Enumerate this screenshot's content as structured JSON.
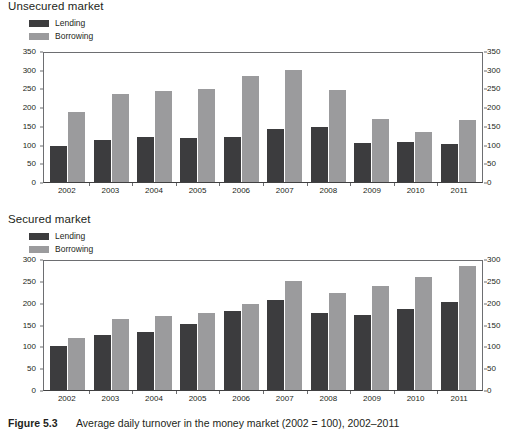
{
  "caption": {
    "figure_number": "Figure 5.3",
    "text": "Average daily turnover in the money market (2002 = 100), 2002–2011"
  },
  "legend": {
    "lending_label": "Lending",
    "borrowing_label": "Borrowing",
    "lending_color": "#3c3c3e",
    "borrowing_color": "#9b9b9d"
  },
  "panels": [
    {
      "title": "Unsecured market"
    },
    {
      "title": "Secured market"
    }
  ],
  "chart_data": [
    {
      "type": "bar",
      "title": "Unsecured market",
      "xlabel": "",
      "ylabel": "",
      "ylim": [
        0,
        350
      ],
      "yticks": [
        0,
        50,
        100,
        150,
        200,
        250,
        300,
        350
      ],
      "ytick_labels": [
        "0",
        "50",
        "100",
        "150",
        "200",
        "250",
        "300",
        "350"
      ],
      "dual_axis": true,
      "grid": false,
      "legend_position": "above-left",
      "categories": [
        "2002",
        "2003",
        "2004",
        "2005",
        "2006",
        "2007",
        "2008",
        "2009",
        "2010",
        "2011"
      ],
      "series": [
        {
          "name": "Lending",
          "color": "#3c3c3e",
          "values": [
            97,
            113,
            121,
            117,
            119,
            141,
            146,
            105,
            107,
            102
          ]
        },
        {
          "name": "Borrowing",
          "color": "#9b9b9d",
          "values": [
            186,
            236,
            243,
            248,
            284,
            298,
            246,
            168,
            134,
            166
          ]
        }
      ]
    },
    {
      "type": "bar",
      "title": "Secured market",
      "xlabel": "",
      "ylabel": "",
      "ylim": [
        0,
        300
      ],
      "yticks": [
        0,
        50,
        100,
        150,
        200,
        250,
        300
      ],
      "ytick_labels": [
        "0",
        "50",
        "100",
        "150",
        "200",
        "250",
        "300"
      ],
      "dual_axis": true,
      "grid": false,
      "legend_position": "above-left",
      "categories": [
        "2002",
        "2003",
        "2004",
        "2005",
        "2006",
        "2007",
        "2008",
        "2009",
        "2010",
        "2011"
      ],
      "series": [
        {
          "name": "Lending",
          "color": "#3c3c3e",
          "values": [
            100,
            127,
            134,
            152,
            180,
            205,
            176,
            171,
            185,
            202
          ]
        },
        {
          "name": "Borrowing",
          "color": "#9b9b9d",
          "values": [
            119,
            162,
            170,
            176,
            198,
            250,
            222,
            239,
            259,
            285
          ]
        }
      ]
    }
  ]
}
